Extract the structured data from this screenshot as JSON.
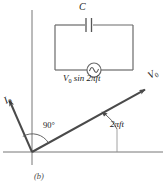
{
  "figure": {
    "panel_label": "(b)",
    "circuit": {
      "capacitor_label": "C",
      "source_label_prefix": "V",
      "source_label_sub": "0",
      "source_label_rest": " sin 2πft",
      "source_label_full": "V0 sin 2πft",
      "source_symbol": "ac-source-sine"
    },
    "phasor": {
      "voltage_label_main": "V",
      "voltage_label_sub": "0",
      "current_label_main": "I",
      "current_label_sub": "0",
      "angle_between_label": "90°",
      "phase_angle_label": "2πft"
    },
    "colors": {
      "ink": "#3a3a3a",
      "axis": "#555555",
      "vector": "#4a4a4a",
      "text": "#1a1a1a",
      "background": "#ffffff"
    },
    "geometry": {
      "origin_x": 32,
      "origin_y": 152,
      "voltage_angle_deg": 29,
      "current_angle_deg": 119,
      "voltage_length": 133,
      "current_length": 63
    }
  }
}
